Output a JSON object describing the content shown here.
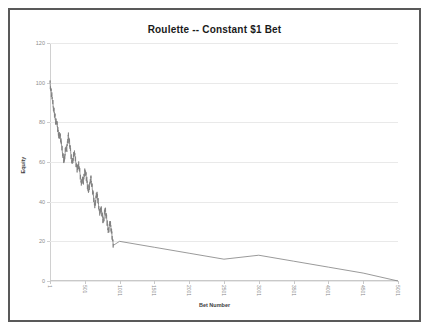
{
  "chart_data": {
    "type": "line",
    "title": "Roulette -- Constant $1 Bet",
    "xlabel": "Bet Number",
    "ylabel": "Equity",
    "xlim": [
      1,
      5001
    ],
    "ylim": [
      0,
      120
    ],
    "grid": true,
    "legend": "none",
    "line_color": "#808080",
    "yticks": [
      0,
      20,
      40,
      60,
      80,
      100,
      120
    ],
    "ytick_labels": [
      "0",
      "20",
      "40",
      "60",
      "80",
      "100",
      "120"
    ],
    "xticks": [
      1,
      501,
      1001,
      1501,
      2001,
      2501,
      3001,
      3501,
      4001,
      4501,
      5001
    ],
    "xtick_labels": [
      "1",
      "501",
      "1001",
      "1501",
      "2001",
      "2501",
      "3001",
      "3501",
      "4001",
      "4501",
      "5001"
    ],
    "series": [
      {
        "name": "Equity",
        "x": [
          1,
          12,
          24,
          36,
          48,
          60,
          72,
          84,
          96,
          108,
          120,
          132,
          144,
          156,
          168,
          180,
          192,
          204,
          216,
          228,
          240,
          252,
          264,
          276,
          288,
          300,
          312,
          324,
          336,
          348,
          360,
          372,
          384,
          396,
          408,
          420,
          432,
          444,
          456,
          468,
          480,
          492,
          504,
          516,
          528,
          540,
          552,
          564,
          576,
          588,
          600,
          612,
          624,
          636,
          648,
          660,
          672,
          684,
          696,
          708,
          720,
          732,
          744,
          756,
          768,
          780,
          792,
          804,
          816,
          828,
          840,
          852,
          864,
          876,
          888,
          900,
          912,
          1000,
          1500,
          2000,
          2500,
          3000,
          3500,
          4000,
          4500,
          5001
        ],
        "values": [
          100,
          97,
          94,
          91,
          88,
          85,
          83,
          80,
          80,
          78,
          75,
          73,
          74,
          71,
          68,
          65,
          62,
          60,
          64,
          67,
          66,
          70,
          73,
          71,
          68,
          64,
          61,
          60,
          62,
          65,
          63,
          60,
          58,
          56,
          59,
          57,
          54,
          51,
          49,
          52,
          50,
          53,
          56,
          54,
          51,
          48,
          45,
          47,
          50,
          52,
          49,
          46,
          43,
          40,
          38,
          41,
          44,
          42,
          39,
          36,
          34,
          37,
          35,
          32,
          30,
          33,
          36,
          34,
          31,
          28,
          25,
          27,
          30,
          27,
          24,
          21,
          18,
          20,
          17,
          14,
          11,
          13,
          10,
          7,
          4,
          0
        ]
      }
    ],
    "annotations": [
      "Equity reaches 0 near bet 900 and remains at 0 thereafter"
    ]
  }
}
